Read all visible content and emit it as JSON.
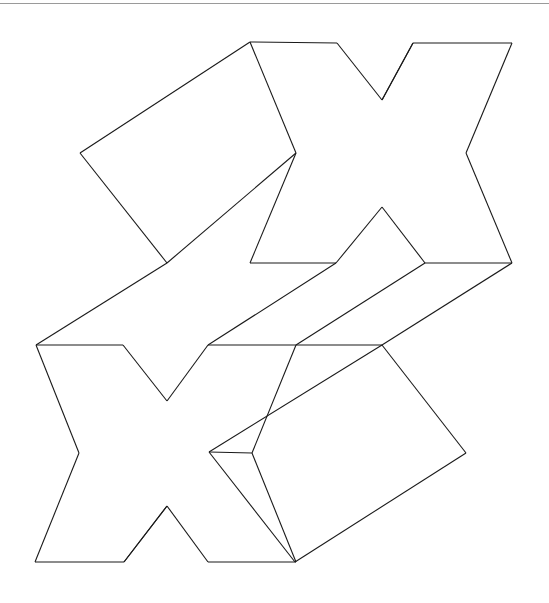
{
  "page": {
    "width": 549,
    "height": 603,
    "background_color": "#ffffff",
    "top_rule": {
      "name": "top-horizontal-rule",
      "color": "#9a9a9a",
      "y": 3,
      "thickness": 1
    }
  },
  "figure": {
    "name": "interlocking-x-net-diagram",
    "stroke_color": "#1a1a1a",
    "fill_color": "none",
    "stroke_width": 1.1,
    "shapes": [
      {
        "name": "upper-x-shape",
        "type": "polygon",
        "points": "250,42 337,43 382,100 413,43 512,43 466,153 512,263 425,263 382,207 336,263 250,263 296,153"
      },
      {
        "name": "upper-left-parallelogram",
        "type": "polygon",
        "points": "250,42 296,153 167,263 80,153"
      },
      {
        "name": "upper-band-left",
        "type": "polygon",
        "points": "167,263 296,153 336,263 208,345 36,345"
      },
      {
        "name": "upper-band-right",
        "type": "polygon",
        "points": "382,207 425,263 296,345 208,345 336,263"
      },
      {
        "name": "upper-band-right-outer",
        "type": "polygon",
        "points": "512,263 425,263 296,345 382,345"
      },
      {
        "name": "lower-x-shape",
        "type": "polygon",
        "points": "36,345 123,345 167,401 208,345 296,345 252,453 296,562 208,562 167,506 124,562 35,562 79,453"
      },
      {
        "name": "lower-right-parallelogram",
        "type": "polygon",
        "points": "382,345 466,453 295,562 209,452"
      },
      {
        "name": "lower-band-connector",
        "type": "polygon",
        "points": "296,345 382,345 209,452 252,453"
      }
    ],
    "segments": [
      {
        "name": "seg-top-left-apex",
        "x1": 250,
        "y1": 42,
        "x2": 337,
        "y2": 43
      },
      {
        "name": "seg-top-notch-down-left",
        "x1": 337,
        "y1": 43,
        "x2": 382,
        "y2": 100
      },
      {
        "name": "seg-top-notch-up-right",
        "x1": 382,
        "y1": 100,
        "x2": 413,
        "y2": 43
      },
      {
        "name": "seg-top-right-run",
        "x1": 413,
        "y1": 43,
        "x2": 512,
        "y2": 43
      },
      {
        "name": "seg-top-notch-thin",
        "x1": 382,
        "y1": 100,
        "x2": 413,
        "y2": 43
      },
      {
        "name": "seg-upper-right-in",
        "x1": 512,
        "y1": 43,
        "x2": 466,
        "y2": 153
      },
      {
        "name": "seg-upper-right-out",
        "x1": 466,
        "y1": 153,
        "x2": 512,
        "y2": 263
      },
      {
        "name": "seg-upper-right-base",
        "x1": 512,
        "y1": 263,
        "x2": 425,
        "y2": 263
      },
      {
        "name": "seg-upper-inner-r-up",
        "x1": 425,
        "y1": 263,
        "x2": 382,
        "y2": 207
      },
      {
        "name": "seg-upper-inner-l-down",
        "x1": 382,
        "y1": 207,
        "x2": 336,
        "y2": 263
      },
      {
        "name": "seg-upper-left-base",
        "x1": 336,
        "y1": 263,
        "x2": 250,
        "y2": 263
      },
      {
        "name": "seg-upper-left-waist",
        "x1": 250,
        "y1": 263,
        "x2": 296,
        "y2": 153
      },
      {
        "name": "seg-upper-left-to-apex",
        "x1": 296,
        "y1": 153,
        "x2": 250,
        "y2": 42
      },
      {
        "name": "seg-rect1-top",
        "x1": 250,
        "y1": 42,
        "x2": 80,
        "y2": 153
      },
      {
        "name": "seg-rect1-left",
        "x1": 80,
        "y1": 153,
        "x2": 167,
        "y2": 263
      },
      {
        "name": "seg-rect1-bottom",
        "x1": 167,
        "y1": 263,
        "x2": 296,
        "y2": 153
      },
      {
        "name": "seg-band-l-lower",
        "x1": 167,
        "y1": 263,
        "x2": 36,
        "y2": 345
      },
      {
        "name": "seg-band-l-upper",
        "x1": 336,
        "y1": 263,
        "x2": 208,
        "y2": 345
      },
      {
        "name": "seg-mid-horiz-left",
        "x1": 36,
        "y1": 345,
        "x2": 123,
        "y2": 345
      },
      {
        "name": "seg-mid-horiz-center",
        "x1": 208,
        "y1": 345,
        "x2": 296,
        "y2": 345
      },
      {
        "name": "seg-mid-horiz-right",
        "x1": 382,
        "y1": 345,
        "x2": 296,
        "y2": 345
      },
      {
        "name": "seg-band-r-upper",
        "x1": 425,
        "y1": 263,
        "x2": 296,
        "y2": 345
      },
      {
        "name": "seg-band-r-lower",
        "x1": 512,
        "y1": 263,
        "x2": 382,
        "y2": 345
      },
      {
        "name": "seg-lower-left-out",
        "x1": 36,
        "y1": 345,
        "x2": 79,
        "y2": 453
      },
      {
        "name": "seg-lower-left-in",
        "x1": 79,
        "y1": 453,
        "x2": 35,
        "y2": 562
      },
      {
        "name": "seg-bottom-horiz-left",
        "x1": 35,
        "y1": 562,
        "x2": 124,
        "y2": 562
      },
      {
        "name": "seg-lower-notch-up",
        "x1": 124,
        "y1": 562,
        "x2": 167,
        "y2": 506
      },
      {
        "name": "seg-lower-notch-down",
        "x1": 167,
        "y1": 506,
        "x2": 208,
        "y2": 562
      },
      {
        "name": "seg-lower-notch-thin",
        "x1": 124,
        "y1": 562,
        "x2": 167,
        "y2": 506
      },
      {
        "name": "seg-bottom-horiz-right",
        "x1": 208,
        "y1": 562,
        "x2": 296,
        "y2": 562
      },
      {
        "name": "seg-lower-x-r-waist",
        "x1": 296,
        "y1": 562,
        "x2": 252,
        "y2": 453
      },
      {
        "name": "seg-lower-x-r-top",
        "x1": 252,
        "y1": 453,
        "x2": 296,
        "y2": 345
      },
      {
        "name": "seg-lower-x-mid-l",
        "x1": 123,
        "y1": 345,
        "x2": 167,
        "y2": 401
      },
      {
        "name": "seg-lower-x-mid-r",
        "x1": 167,
        "y1": 401,
        "x2": 208,
        "y2": 345
      },
      {
        "name": "seg-rect2-top",
        "x1": 382,
        "y1": 345,
        "x2": 466,
        "y2": 453
      },
      {
        "name": "seg-rect2-right",
        "x1": 466,
        "y1": 453,
        "x2": 295,
        "y2": 562
      },
      {
        "name": "seg-rect2-bottom",
        "x1": 295,
        "y1": 562,
        "x2": 209,
        "y2": 452
      },
      {
        "name": "seg-rect2-left",
        "x1": 209,
        "y1": 452,
        "x2": 382,
        "y2": 345
      },
      {
        "name": "seg-rect2-inner",
        "x1": 209,
        "y1": 452,
        "x2": 252,
        "y2": 453
      }
    ]
  }
}
